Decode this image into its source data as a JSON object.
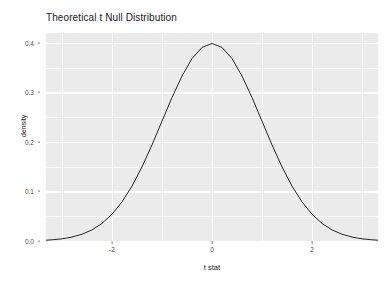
{
  "chart_data": {
    "type": "line",
    "title": "Theoretical t Null Distribution",
    "xlabel": "t stat",
    "ylabel": "density",
    "xlim": [
      -3.32,
      3.32
    ],
    "ylim": [
      0.0,
      0.42
    ],
    "grid": true,
    "legend": "none",
    "x_ticks": [
      {
        "value": -2,
        "label": "-2"
      },
      {
        "value": 0,
        "label": "0"
      },
      {
        "value": 2,
        "label": "2"
      }
    ],
    "x_minor_ticks": [
      -3,
      -1,
      1,
      3
    ],
    "y_ticks": [
      {
        "value": 0.0,
        "label": "0.0"
      },
      {
        "value": 0.1,
        "label": "0.1"
      },
      {
        "value": 0.2,
        "label": "0.2"
      },
      {
        "value": 0.3,
        "label": "0.3"
      },
      {
        "value": 0.4,
        "label": "0.4"
      }
    ],
    "y_minor_ticks": [
      0.05,
      0.15,
      0.25,
      0.35
    ],
    "series": [
      {
        "name": "theoretical t null density",
        "color": "#262626",
        "line_width": 1.0,
        "x": [
          -3.32,
          -3.2,
          -3.0,
          -2.8,
          -2.6,
          -2.4,
          -2.2,
          -2.0,
          -1.8,
          -1.6,
          -1.4,
          -1.2,
          -1.0,
          -0.8,
          -0.6,
          -0.4,
          -0.2,
          0.0,
          0.2,
          0.4,
          0.6,
          0.8,
          1.0,
          1.2,
          1.4,
          1.6,
          1.8,
          2.0,
          2.2,
          2.4,
          2.6,
          2.8,
          3.0,
          3.2,
          3.32
        ],
        "y": [
          0.0016,
          0.0024,
          0.0044,
          0.0079,
          0.0136,
          0.0224,
          0.0355,
          0.054,
          0.079,
          0.1109,
          0.1497,
          0.1942,
          0.242,
          0.2897,
          0.3332,
          0.3683,
          0.391,
          0.3989,
          0.391,
          0.3683,
          0.3332,
          0.2897,
          0.242,
          0.1942,
          0.1497,
          0.1109,
          0.079,
          0.054,
          0.0355,
          0.0224,
          0.0136,
          0.0079,
          0.0044,
          0.0024,
          0.0016
        ]
      }
    ],
    "peak": {
      "x": 0,
      "y": 0.399
    },
    "colors": {
      "panel_background": "#ebebeb",
      "gridline": "#ffffff",
      "curve": "#262626",
      "axis_text": "#4d4d4d",
      "title_text": "#1a1a1a",
      "page_background": "#ffffff"
    }
  }
}
